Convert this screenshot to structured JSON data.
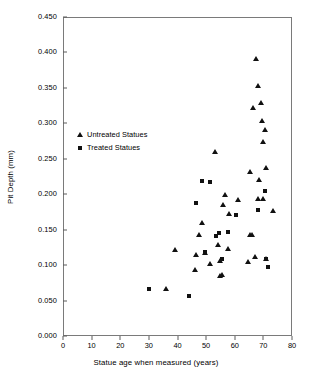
{
  "chart_data": {
    "type": "scatter",
    "title": "",
    "xlabel": "Statue age when measured (years)",
    "ylabel": "Pit Depth (mm)",
    "xlim": [
      0,
      80
    ],
    "ylim": [
      0.0,
      0.45
    ],
    "xticks": [
      0,
      10,
      20,
      30,
      40,
      50,
      60,
      70,
      80
    ],
    "xtick_labels": [
      "0",
      "10",
      "20",
      "30",
      "40",
      "50",
      "60",
      "70",
      "80"
    ],
    "yticks": [
      0.0,
      0.05,
      0.1,
      0.15,
      0.2,
      0.25,
      0.3,
      0.35,
      0.4,
      0.45
    ],
    "ytick_labels": [
      "0.000",
      "0.050",
      "0.100",
      "0.150",
      "0.200",
      "0.250",
      "0.300",
      "0.350",
      "0.400",
      "0.450"
    ],
    "grid": false,
    "legend_position": "upper-left-inside",
    "marker_color": "#111111",
    "frame_color": "#7a7a7a",
    "series": [
      {
        "name": "Untreated Statues",
        "marker": "triangle",
        "points": [
          [
            36.0,
            0.067
          ],
          [
            39.0,
            0.122
          ],
          [
            46.0,
            0.093
          ],
          [
            46.5,
            0.114
          ],
          [
            47.5,
            0.143
          ],
          [
            48.5,
            0.16
          ],
          [
            49.5,
            0.117
          ],
          [
            51.5,
            0.102
          ],
          [
            53.0,
            0.259
          ],
          [
            54.0,
            0.128
          ],
          [
            55.0,
            0.106
          ],
          [
            55.0,
            0.084
          ],
          [
            55.5,
            0.086
          ],
          [
            56.0,
            0.185
          ],
          [
            56.5,
            0.199
          ],
          [
            57.5,
            0.123
          ],
          [
            58.0,
            0.172
          ],
          [
            61.0,
            0.192
          ],
          [
            64.5,
            0.105
          ],
          [
            65.5,
            0.231
          ],
          [
            65.5,
            0.143
          ],
          [
            66.0,
            0.143
          ],
          [
            66.5,
            0.321
          ],
          [
            67.0,
            0.111
          ],
          [
            67.5,
            0.391
          ],
          [
            68.0,
            0.352
          ],
          [
            68.0,
            0.193
          ],
          [
            68.5,
            0.22
          ],
          [
            69.0,
            0.328
          ],
          [
            69.5,
            0.303
          ],
          [
            70.0,
            0.193
          ],
          [
            70.0,
            0.274
          ],
          [
            70.5,
            0.291
          ],
          [
            71.0,
            0.237
          ],
          [
            71.0,
            0.108
          ],
          [
            73.5,
            0.177
          ]
        ]
      },
      {
        "name": "Treated Statues",
        "marker": "square",
        "points": [
          [
            30.0,
            0.067
          ],
          [
            44.0,
            0.057
          ],
          [
            46.5,
            0.187
          ],
          [
            48.5,
            0.219
          ],
          [
            49.5,
            0.118
          ],
          [
            51.5,
            0.217
          ],
          [
            53.5,
            0.141
          ],
          [
            54.5,
            0.145
          ],
          [
            55.5,
            0.108
          ],
          [
            57.5,
            0.147
          ],
          [
            60.5,
            0.17
          ],
          [
            68.0,
            0.178
          ],
          [
            70.5,
            0.204
          ],
          [
            71.0,
            0.108
          ],
          [
            71.5,
            0.097
          ]
        ]
      }
    ]
  },
  "legend": {
    "items": [
      {
        "label": "Untreated Statues",
        "marker": "triangle"
      },
      {
        "label": "Treated Statues",
        "marker": "square"
      }
    ]
  }
}
